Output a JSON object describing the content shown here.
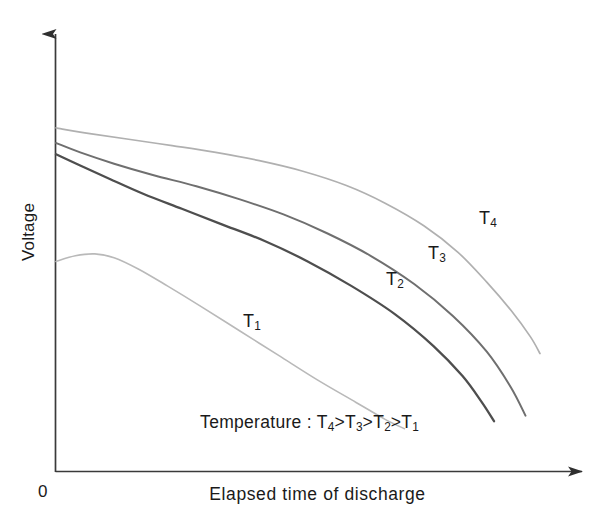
{
  "chart_data": {
    "type": "line",
    "title": "",
    "xlabel": "Elapsed time of discharge",
    "ylabel": "Voltage",
    "origin_label": "0",
    "grid": false,
    "axes": {
      "style": "arrow",
      "x_range_label": "0 to unlabeled maximum",
      "y_range_label": "0 to unlabeled maximum",
      "ticks": "none"
    },
    "annotation": {
      "prefix": "Temperature : ",
      "inequality": "T4>T3>T2>T1",
      "parts": [
        {
          "sym": "T",
          "sub": "4"
        },
        {
          "op": ">"
        },
        {
          "sym": "T",
          "sub": "3"
        },
        {
          "op": ">"
        },
        {
          "sym": "T",
          "sub": "2"
        },
        {
          "op": ">"
        },
        {
          "sym": "T",
          "sub": "1"
        }
      ]
    },
    "legend_position": "inline-curve-labels",
    "series": [
      {
        "name": "T1",
        "label_symbol": "T",
        "label_subscript": "1",
        "color": "#b9b9b9",
        "stroke_width": 1.6,
        "description": "Lowest temperature; starts lowest, slight rise then steep near-linear decline ending earliest.",
        "points": [
          [
            0.0,
            0.56
          ],
          [
            0.04,
            0.575
          ],
          [
            0.08,
            0.58
          ],
          [
            0.12,
            0.57
          ],
          [
            0.17,
            0.54
          ],
          [
            0.23,
            0.495
          ],
          [
            0.3,
            0.44
          ],
          [
            0.38,
            0.375
          ],
          [
            0.46,
            0.31
          ],
          [
            0.54,
            0.245
          ],
          [
            0.62,
            0.185
          ],
          [
            0.68,
            0.14
          ],
          [
            0.72,
            0.115
          ]
        ]
      },
      {
        "name": "T2",
        "label_symbol": "T",
        "label_subscript": "2",
        "color": "#4e4e4e",
        "stroke_width": 2.3,
        "description": "Second lowest temperature; darkest line, gentle plateau then sharp knee-drop.",
        "points": [
          [
            0.0,
            0.845
          ],
          [
            0.05,
            0.815
          ],
          [
            0.11,
            0.78
          ],
          [
            0.18,
            0.74
          ],
          [
            0.26,
            0.7
          ],
          [
            0.34,
            0.66
          ],
          [
            0.43,
            0.615
          ],
          [
            0.52,
            0.56
          ],
          [
            0.61,
            0.495
          ],
          [
            0.7,
            0.42
          ],
          [
            0.78,
            0.335
          ],
          [
            0.84,
            0.255
          ],
          [
            0.88,
            0.185
          ],
          [
            0.905,
            0.135
          ]
        ]
      },
      {
        "name": "T3",
        "label_symbol": "T",
        "label_subscript": "3",
        "color": "#6f6f6f",
        "stroke_width": 2.0,
        "description": "Third temperature; mid-gray line above T2, longer plateau before knee.",
        "points": [
          [
            0.0,
            0.875
          ],
          [
            0.05,
            0.85
          ],
          [
            0.12,
            0.82
          ],
          [
            0.2,
            0.79
          ],
          [
            0.29,
            0.76
          ],
          [
            0.38,
            0.725
          ],
          [
            0.47,
            0.685
          ],
          [
            0.56,
            0.635
          ],
          [
            0.65,
            0.575
          ],
          [
            0.74,
            0.5
          ],
          [
            0.82,
            0.415
          ],
          [
            0.89,
            0.32
          ],
          [
            0.94,
            0.225
          ],
          [
            0.97,
            0.15
          ]
        ]
      },
      {
        "name": "T4",
        "label_symbol": "T",
        "label_subscript": "4",
        "color": "#b0b0b0",
        "stroke_width": 1.7,
        "description": "Highest temperature; light-gray topmost curve, flattest plateau and latest knee.",
        "points": [
          [
            0.0,
            0.915
          ],
          [
            0.07,
            0.9
          ],
          [
            0.15,
            0.885
          ],
          [
            0.24,
            0.868
          ],
          [
            0.33,
            0.85
          ],
          [
            0.42,
            0.828
          ],
          [
            0.51,
            0.8
          ],
          [
            0.6,
            0.762
          ],
          [
            0.68,
            0.715
          ],
          [
            0.76,
            0.655
          ],
          [
            0.83,
            0.585
          ],
          [
            0.89,
            0.505
          ],
          [
            0.94,
            0.43
          ],
          [
            0.98,
            0.36
          ],
          [
            1.0,
            0.315
          ]
        ]
      }
    ]
  },
  "axis": {
    "y_title": "Voltage",
    "x_title": "Elapsed time of discharge",
    "origin": "0"
  },
  "annotation_text": {
    "temperature_prefix": "Temperature : ",
    "t4": "T",
    "t4_sub": "4",
    "gt1": ">",
    "t3": "T",
    "t3_sub": "3",
    "gt2": ">",
    "t2": "T",
    "t2_sub": "2",
    "gt3": ">",
    "t1": "T",
    "t1_sub": "1"
  },
  "curve_labels": {
    "t1": "T",
    "t1_sub": "1",
    "t2": "T",
    "t2_sub": "2",
    "t3": "T",
    "t3_sub": "3",
    "t4": "T",
    "t4_sub": "4"
  },
  "colors": {
    "axis": "#3a3a3a",
    "text": "#1a1a1a",
    "t1": "#b9b9b9",
    "t2": "#4e4e4e",
    "t3": "#6f6f6f",
    "t4": "#b0b0b0",
    "background": "#ffffff"
  }
}
